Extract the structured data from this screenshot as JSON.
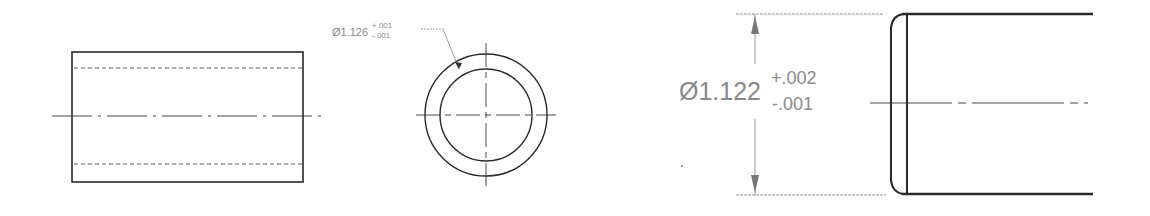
{
  "drawing": {
    "views": [
      {
        "name": "side-view",
        "description": "Tube side view with hidden bore lines and centerline"
      },
      {
        "name": "end-view",
        "description": "Tube end view, concentric circles with center mark"
      },
      {
        "name": "detail-view",
        "description": "Enlarged tube end with chamfer and diameter dimension"
      }
    ],
    "end_view_dimension": {
      "symbol": "Ø",
      "nominal": "1.126",
      "tol_plus": "+.001",
      "tol_minus": "-.001"
    },
    "detail_dimension": {
      "symbol": "Ø",
      "nominal": "1.122",
      "tol_plus": "+.002",
      "tol_minus": "-.001"
    },
    "colors": {
      "line": "#2a2a2a",
      "dimension": "#8a8a8a",
      "background": "#ffffff"
    }
  }
}
